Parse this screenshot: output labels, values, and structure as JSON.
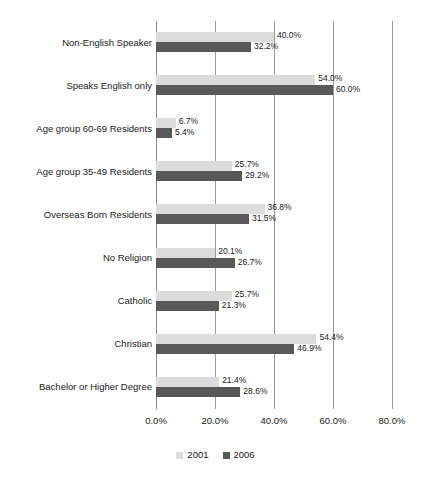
{
  "chart_data": {
    "type": "bar",
    "orientation": "horizontal",
    "title": "",
    "subtitle": "",
    "xlabel": "",
    "ylabel": "",
    "xlim": [
      0,
      80
    ],
    "xticks": [
      "0.0%",
      "20.0%",
      "40.0%",
      "60.0%",
      "80.0%"
    ],
    "xtick_values": [
      0,
      20,
      40,
      60,
      80
    ],
    "grid": true,
    "legend_position": "bottom",
    "categories": [
      "Non-English Speaker",
      "Speaks English only",
      "Age group 60-69 Residents",
      "Age group 35-49 Residents",
      "Overseas Born Residents",
      "No Religion",
      "Catholic",
      "Christian",
      "Bachelor or Higher Degree"
    ],
    "series": [
      {
        "name": "2001",
        "color": "#dcdcdc",
        "values": [
          40.0,
          54.0,
          6.7,
          25.7,
          36.8,
          20.1,
          25.7,
          54.4,
          21.4
        ],
        "labels": [
          "40.0%",
          "54.0%",
          "6.7%",
          "25.7%",
          "36.8%",
          "20.1%",
          "25.7%",
          "54.4%",
          "21.4%"
        ]
      },
      {
        "name": "2006",
        "color": "#595959",
        "values": [
          32.2,
          60.0,
          5.4,
          29.2,
          31.5,
          26.7,
          21.3,
          46.9,
          28.6
        ],
        "labels": [
          "32.2%",
          "60.0%",
          "5.4%",
          "29.2%",
          "31.5%",
          "26.7%",
          "21.3%",
          "46.9%",
          "28.6%"
        ]
      }
    ]
  },
  "legend": {
    "items": [
      {
        "label": "2001",
        "color": "#dcdcdc"
      },
      {
        "label": "2006",
        "color": "#595959"
      }
    ]
  }
}
